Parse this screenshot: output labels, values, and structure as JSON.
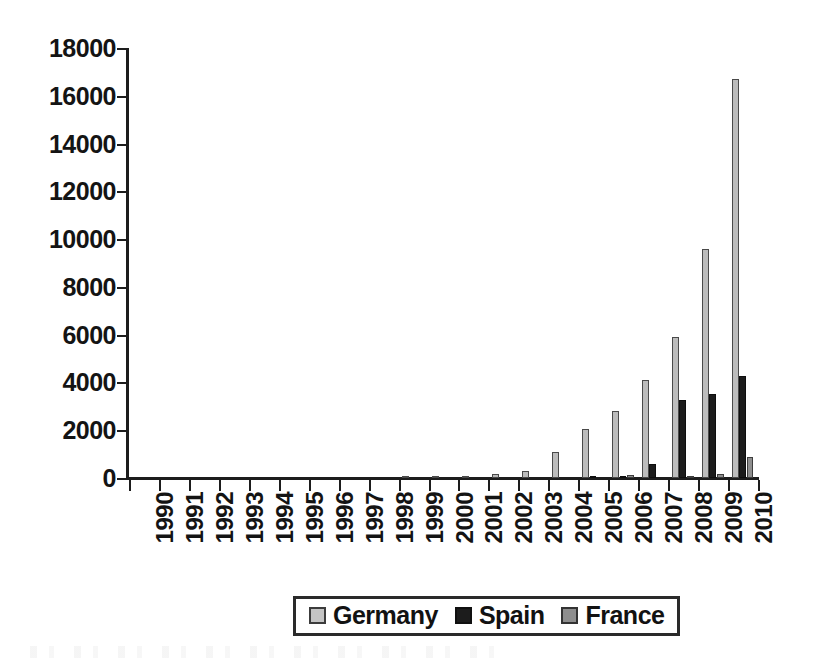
{
  "chart_data": {
    "type": "bar",
    "title": "",
    "subtitle": "",
    "xlabel": "",
    "ylabel": "",
    "ylim": [
      0,
      18000
    ],
    "ytick_step": 2000,
    "yticks": [
      0,
      2000,
      4000,
      6000,
      8000,
      10000,
      12000,
      14000,
      16000,
      18000
    ],
    "ytick_labels": [
      "0",
      "2000",
      "4000",
      "6000",
      "8000",
      "10000",
      "12000",
      "14000",
      "16000",
      "18000"
    ],
    "grid": false,
    "legend_position": "bottom-center",
    "categories": [
      "1990",
      "1991",
      "1992",
      "1993",
      "1994",
      "1995",
      "1996",
      "1997",
      "1998",
      "1999",
      "2000",
      "2001",
      "2002",
      "2003",
      "2004",
      "2005",
      "2006",
      "2007",
      "2008",
      "2009",
      "2010"
    ],
    "series": [
      {
        "name": "Germany",
        "color": "#bcbcbc",
        "values": [
          0,
          0,
          0,
          0,
          0,
          0,
          0,
          0,
          0,
          60,
          50,
          80,
          150,
          300,
          1100,
          2050,
          2800,
          4100,
          5900,
          9600,
          16700
        ]
      },
      {
        "name": "Spain",
        "color": "#1c1c1c",
        "values": [
          0,
          0,
          0,
          0,
          0,
          0,
          0,
          0,
          0,
          0,
          0,
          0,
          0,
          0,
          0,
          20,
          80,
          600,
          3250,
          3500,
          4250
        ]
      },
      {
        "name": "France",
        "color": "#8e8e8e",
        "values": [
          0,
          0,
          0,
          0,
          0,
          0,
          0,
          0,
          0,
          0,
          0,
          0,
          0,
          0,
          0,
          0,
          120,
          0,
          50,
          150,
          900
        ]
      }
    ]
  },
  "legend": {
    "entries": [
      {
        "label": "Germany",
        "swatch": "legend-swatch-germany"
      },
      {
        "label": "Spain",
        "swatch": "legend-swatch-spain"
      },
      {
        "label": "France",
        "swatch": "legend-swatch-france"
      }
    ]
  }
}
